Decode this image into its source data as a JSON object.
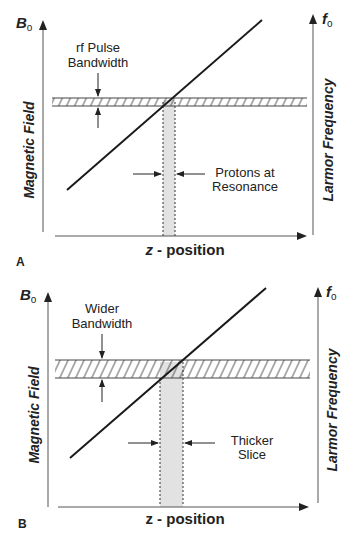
{
  "panels": [
    {
      "id": "A",
      "panel_label": "A",
      "y_axis_left": {
        "symbol": "B",
        "subscript": "o",
        "title": "Magnetic Field"
      },
      "y_axis_right": {
        "symbol": "f",
        "subscript": "o",
        "title": "Larmor Frequency"
      },
      "x_axis": {
        "title_var": "z",
        "title_rest": " - position"
      },
      "bandwidth_label": [
        "rf Pulse",
        "Bandwidth"
      ],
      "slice_label": [
        "Protons at",
        "Resonance"
      ]
    },
    {
      "id": "B",
      "panel_label": "B",
      "y_axis_left": {
        "symbol": "B",
        "subscript": "o",
        "title": "Magnetic Field"
      },
      "y_axis_right": {
        "symbol": "f",
        "subscript": "o",
        "title": "Larmor Frequency"
      },
      "x_axis": {
        "title_var": "z",
        "title_rest": " - position"
      },
      "bandwidth_label": [
        "Wider",
        "Bandwidth"
      ],
      "slice_label": [
        "Thicker",
        "Slice"
      ]
    }
  ],
  "colors": {
    "line": "#1a1a1a",
    "axis": "#555555",
    "slice_fill": "#e2e2e2",
    "text": "#222222"
  }
}
